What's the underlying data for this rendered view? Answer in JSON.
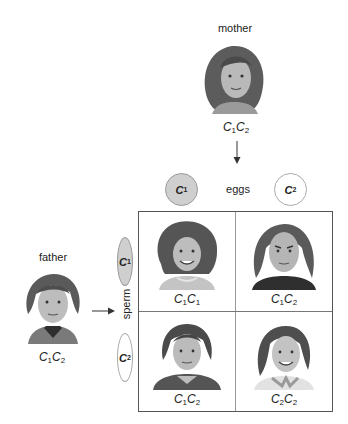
{
  "parents": {
    "mother": {
      "label": "mother",
      "genotype": [
        "C",
        "1",
        "C",
        "2"
      ]
    },
    "father": {
      "label": "father",
      "genotype": [
        "C",
        "1",
        "C",
        "2"
      ]
    }
  },
  "gametes": {
    "eggs_label": "eggs",
    "sperm_label": "sperm",
    "eggs": [
      {
        "allele": "C",
        "sub": "1",
        "fill": "#cfcfcf"
      },
      {
        "allele": "C",
        "sub": "2",
        "fill": "#ffffff"
      }
    ],
    "sperm": [
      {
        "allele": "C",
        "sub": "1",
        "fill": "#cfcfcf"
      },
      {
        "allele": "C",
        "sub": "2",
        "fill": "#ffffff"
      }
    ]
  },
  "punnett": {
    "cells": [
      {
        "row": 1,
        "col": 1,
        "a": "C",
        "a_sub": "1",
        "b": "C",
        "b_sub": "1",
        "portrait": "girl-curly-hair"
      },
      {
        "row": 1,
        "col": 2,
        "a": "C",
        "a_sub": "1",
        "b": "C",
        "b_sub": "2",
        "portrait": "woman-long-hair"
      },
      {
        "row": 2,
        "col": 1,
        "a": "C",
        "a_sub": "1",
        "b": "C",
        "b_sub": "2",
        "portrait": "young-man"
      },
      {
        "row": 2,
        "col": 2,
        "a": "C",
        "a_sub": "2",
        "b": "C",
        "b_sub": "2",
        "portrait": "girl-straight-hair"
      }
    ]
  },
  "colors": {
    "filled_gamete": "#cfcfcf",
    "grid_border": "#555555",
    "text": "#222222"
  }
}
